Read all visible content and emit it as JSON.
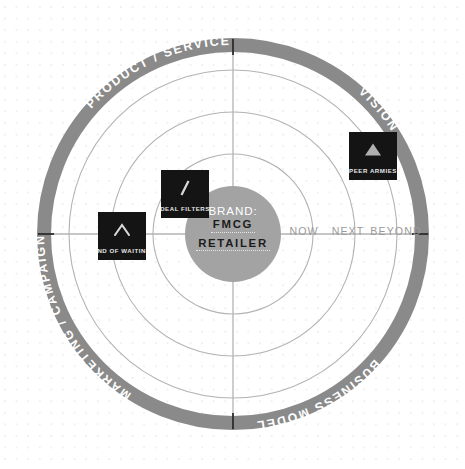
{
  "canvas": {
    "width": 465,
    "height": 469,
    "background": "#ffffff",
    "dot_grid_color": "#f2f0f1"
  },
  "radar": {
    "center": {
      "x": 233,
      "y": 234
    },
    "ring_band_color": "#8a8a8a",
    "ring_line_color": "#b3b3b3",
    "axis_color": "#b3b3b3",
    "axis_tick_color": "#1a1a1a",
    "outer_radius": 196,
    "band_inner_radius": 182,
    "grid_radii": [
      164,
      122,
      80
    ],
    "hub_radius": 48,
    "hub_color": "#a3a3a3"
  },
  "quadrants": [
    {
      "label": "PRODUCT / SERVICE",
      "position": "upper-left"
    },
    {
      "label": "VISION",
      "position": "upper-right"
    },
    {
      "label": "BUSINESS MODEL",
      "position": "lower-right"
    },
    {
      "label": "MARKETING / CAMPAIGNS",
      "position": "lower-left"
    }
  ],
  "horizons": [
    {
      "label": "NOW",
      "x": 304,
      "y": 231
    },
    {
      "label": "NEXT",
      "x": 348,
      "y": 231
    },
    {
      "label": "BEYOND",
      "x": 396,
      "y": 231
    }
  ],
  "center": {
    "caption": "BRAND:",
    "line1": "FMCG",
    "line2": "RETAILER"
  },
  "cards": [
    {
      "label": "END OF WAITING",
      "icon": "chevron-up-icon",
      "x": 98,
      "y": 212,
      "size": 48
    },
    {
      "label": "DEAL FILTERS",
      "icon": "slash-icon",
      "x": 161,
      "y": 170,
      "size": 48
    },
    {
      "label": "PEER ARMIES",
      "icon": "triangle-up-icon",
      "x": 349,
      "y": 132,
      "size": 48
    }
  ]
}
